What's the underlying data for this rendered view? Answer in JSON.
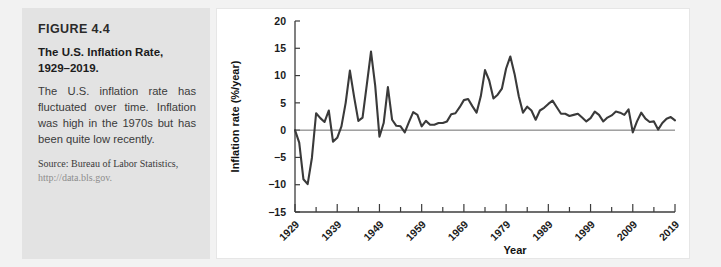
{
  "caption": {
    "figure_number": "FIGURE 4.4",
    "title": "The U.S. Inflation Rate, 1929–2019.",
    "description": "The U.S. inflation rate has fluctuated over time. Inflation was high in the 1970s but has been quite low recently.",
    "source": "Source: Bureau of Labor Statistics,",
    "source_url": "http://data.bls.gov."
  },
  "colors": {
    "panel_background": "#e3e3e3",
    "page_background": "#f2f2f2",
    "chart_background": "#ffffff",
    "line_color": "#3a3a3a",
    "axis_color": "#3c3c3c"
  },
  "chart_data": {
    "type": "line",
    "title": "",
    "xlabel": "Year",
    "ylabel": "Inflation rate (%/year)",
    "xlim": [
      1929,
      2019
    ],
    "ylim": [
      -15,
      20
    ],
    "ytick_labels": [
      "20",
      "15",
      "10",
      "5",
      "0",
      "−5",
      "−10",
      "−15"
    ],
    "yticks": [
      20,
      15,
      10,
      5,
      0,
      -5,
      -10,
      -15
    ],
    "xtick_labels": [
      "1929",
      "1939",
      "1949",
      "1959",
      "1969",
      "1979",
      "1989",
      "1999",
      "2009",
      "2019"
    ],
    "xticks": [
      1929,
      1939,
      1949,
      1959,
      1969,
      1979,
      1989,
      1999,
      2009,
      2019
    ],
    "minor_xtick_interval": 5,
    "grid": false,
    "legend": false,
    "zero_reference_line": 0,
    "x": [
      1929,
      1930,
      1931,
      1932,
      1933,
      1934,
      1935,
      1936,
      1937,
      1938,
      1939,
      1940,
      1941,
      1942,
      1943,
      1944,
      1945,
      1946,
      1947,
      1948,
      1949,
      1950,
      1951,
      1952,
      1953,
      1954,
      1955,
      1956,
      1957,
      1958,
      1959,
      1960,
      1961,
      1962,
      1963,
      1964,
      1965,
      1966,
      1967,
      1968,
      1969,
      1970,
      1971,
      1972,
      1973,
      1974,
      1975,
      1976,
      1977,
      1978,
      1979,
      1980,
      1981,
      1982,
      1983,
      1984,
      1985,
      1986,
      1987,
      1988,
      1989,
      1990,
      1991,
      1992,
      1993,
      1994,
      1995,
      1996,
      1997,
      1998,
      1999,
      2000,
      2001,
      2002,
      2003,
      2004,
      2005,
      2006,
      2007,
      2008,
      2009,
      2010,
      2011,
      2012,
      2013,
      2014,
      2015,
      2016,
      2017,
      2018,
      2019
    ],
    "values": [
      0.0,
      -2.3,
      -9.0,
      -9.9,
      -5.1,
      3.1,
      2.2,
      1.5,
      3.6,
      -2.1,
      -1.4,
      0.7,
      5.0,
      10.9,
      6.1,
      1.7,
      2.3,
      8.3,
      14.4,
      8.1,
      -1.2,
      1.3,
      7.9,
      1.9,
      0.8,
      0.7,
      -0.4,
      1.5,
      3.3,
      2.8,
      0.7,
      1.7,
      1.0,
      1.0,
      1.3,
      1.3,
      1.6,
      2.9,
      3.1,
      4.2,
      5.5,
      5.7,
      4.4,
      3.2,
      6.2,
      11.0,
      9.1,
      5.8,
      6.5,
      7.6,
      11.3,
      13.5,
      10.3,
      6.2,
      3.2,
      4.3,
      3.6,
      1.9,
      3.6,
      4.1,
      4.8,
      5.4,
      4.2,
      3.0,
      3.0,
      2.6,
      2.8,
      3.0,
      2.3,
      1.6,
      2.2,
      3.4,
      2.8,
      1.6,
      2.3,
      2.7,
      3.4,
      3.2,
      2.8,
      3.8,
      -0.4,
      1.6,
      3.2,
      2.1,
      1.5,
      1.6,
      0.1,
      1.3,
      2.1,
      2.4,
      1.8
    ]
  }
}
